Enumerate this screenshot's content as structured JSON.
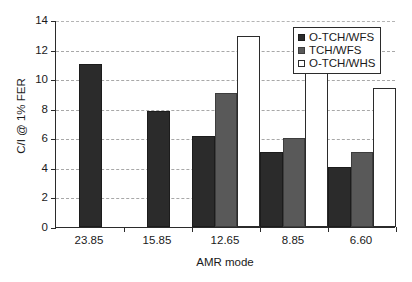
{
  "chart_data": {
    "type": "bar",
    "title": "",
    "xlabel": "AMR mode",
    "ylabel": "C/I @ 1% FER",
    "categories": [
      "23.85",
      "15.85",
      "12.65",
      "8.85",
      "6.60"
    ],
    "ylim": [
      0,
      14
    ],
    "yticks": [
      0,
      2,
      4,
      6,
      8,
      10,
      12,
      14
    ],
    "ytick_labels": [
      "0",
      "2",
      "4",
      "6",
      "8",
      "10",
      "12",
      "14"
    ],
    "grid": true,
    "legend_position": "top-right",
    "series": [
      {
        "name": "O-TCH/WFS",
        "color": "#2b2b2b",
        "values": [
          11.0,
          7.85,
          6.15,
          5.05,
          4.05
        ],
        "present": [
          true,
          true,
          true,
          true,
          true
        ]
      },
      {
        "name": "TCH/WFS",
        "color": "#595959",
        "values": [
          null,
          null,
          9.05,
          6.05,
          5.05
        ],
        "present": [
          false,
          false,
          true,
          true,
          true
        ]
      },
      {
        "name": "O-TCH/WHS",
        "color": "#ffffff",
        "values": [
          null,
          null,
          12.9,
          11.3,
          9.4
        ],
        "present": [
          false,
          false,
          true,
          true,
          true
        ]
      }
    ]
  },
  "legend": {
    "items": [
      {
        "label": "O-TCH/WFS",
        "swatch": "legend-swatch-dark"
      },
      {
        "label": "TCH/WFS",
        "swatch": "legend-swatch-gray"
      },
      {
        "label": "O-TCH/WHS",
        "swatch": "legend-swatch-white"
      }
    ]
  }
}
